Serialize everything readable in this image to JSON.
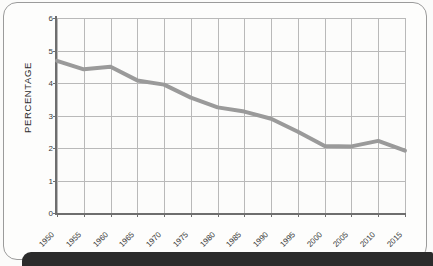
{
  "chart_data": {
    "type": "line",
    "title": "",
    "xlabel": "",
    "ylabel": "PERCENTAGE",
    "categories": [
      "1950",
      "1955",
      "1960",
      "1965",
      "1970",
      "1975",
      "1980",
      "1985",
      "1990",
      "1995",
      "2000",
      "2005",
      "2010",
      "2015"
    ],
    "x": [
      1950,
      1955,
      1960,
      1965,
      1970,
      1975,
      1980,
      1985,
      1990,
      1995,
      2000,
      2005,
      2010,
      2015
    ],
    "values": [
      4.68,
      4.42,
      4.5,
      4.08,
      3.95,
      3.55,
      3.25,
      3.12,
      2.9,
      2.5,
      2.06,
      2.05,
      2.22,
      1.92
    ],
    "series": [
      {
        "name": "percentage",
        "values": [
          4.68,
          4.42,
          4.5,
          4.08,
          3.95,
          3.55,
          3.25,
          3.12,
          2.9,
          2.5,
          2.06,
          2.05,
          2.22,
          1.92
        ]
      }
    ],
    "ylim": [
      0,
      6
    ],
    "yticks": [
      0,
      1,
      2,
      3,
      4,
      5,
      6
    ],
    "ytick_labels": [
      "0",
      "1",
      "2",
      "3",
      "4",
      "5",
      "6"
    ],
    "grid": true,
    "legend": "none",
    "line_color": "#9a9a9a",
    "grid_color": "#b9b9b9",
    "axis_color": "#6e6e6e",
    "background_color": "#fcfcfb"
  },
  "page": {
    "caption_band_color": "#2b2b2b",
    "frame_color": "#9b9b9b"
  }
}
